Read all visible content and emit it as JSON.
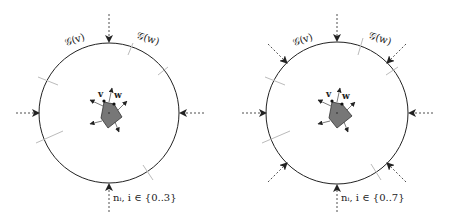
{
  "panels": [
    {
      "id": "left",
      "center": [
        109,
        113
      ],
      "radius": 70,
      "normals_count": 4,
      "label_gv": "𝒢(v)",
      "label_gw": "𝒢(w)",
      "vertex_v": "v",
      "vertex_w": "w",
      "normals_label": "nᵢ, i ∈ {0..3}"
    },
    {
      "id": "right",
      "center": [
        337,
        113
      ],
      "radius": 71,
      "normals_count": 8,
      "label_gv": "𝒢(v)",
      "label_gw": "𝒢(w)",
      "vertex_v": "v",
      "vertex_w": "w",
      "normals_label": "nᵢ, i ∈ {0..7}"
    }
  ],
  "colors": {
    "circle": "#222222",
    "polygon_fill": "#777777",
    "tick": "#bbbbbb",
    "arrow": "#222222"
  }
}
